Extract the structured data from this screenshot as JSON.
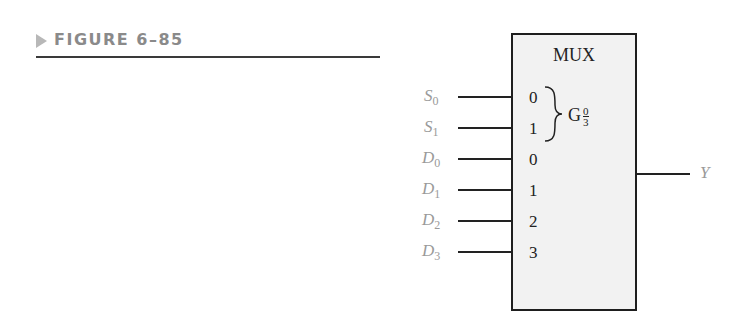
{
  "figure": {
    "label": "FIGURE 6–85"
  },
  "mux": {
    "title": "MUX",
    "select_group": {
      "prefix": "G",
      "frac_num": "0",
      "frac_den": "3"
    },
    "select_pins": [
      {
        "num": "0",
        "signal": "S",
        "sub": "0"
      },
      {
        "num": "1",
        "signal": "S",
        "sub": "1"
      }
    ],
    "data_pins": [
      {
        "num": "0",
        "signal": "D",
        "sub": "0"
      },
      {
        "num": "1",
        "signal": "D",
        "sub": "1"
      },
      {
        "num": "2",
        "signal": "D",
        "sub": "2"
      },
      {
        "num": "3",
        "signal": "D",
        "sub": "3"
      }
    ],
    "output": {
      "signal": "Y"
    }
  }
}
